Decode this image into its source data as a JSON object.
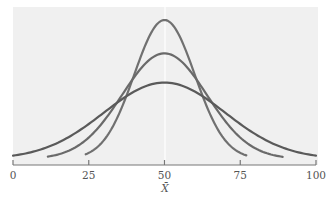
{
  "chart_data": {
    "type": "line",
    "title": "",
    "xlabel": "X̄",
    "ylabel": "",
    "xlim": [
      0,
      100
    ],
    "x_ticks": [
      0,
      25,
      50,
      75,
      100
    ],
    "x_tick_labels": [
      "0",
      "25",
      "50",
      "75",
      "100"
    ],
    "grid": false,
    "legend": "none",
    "background_panel": "#f0f0f0",
    "center_line": {
      "x": 50,
      "color": "#ffffff"
    },
    "series": [
      {
        "name": "narrow distribution",
        "mean": 50,
        "sd": 10,
        "x_range": [
          24,
          77
        ],
        "peak_relative_height": 1.0,
        "color": "#707070"
      },
      {
        "name": "medium distribution",
        "mean": 50,
        "sd": 14,
        "x_range": [
          11.5,
          89
        ],
        "peak_relative_height": 0.76,
        "color": "#6a6a6a"
      },
      {
        "name": "wide distribution",
        "mean": 50,
        "sd": 20,
        "x_range": [
          0,
          100
        ],
        "peak_relative_height": 0.55,
        "color": "#5a5a5a"
      }
    ]
  }
}
